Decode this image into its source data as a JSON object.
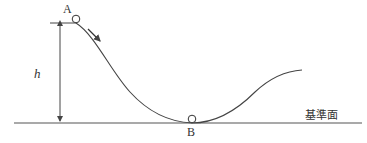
{
  "diagram": {
    "type": "physics-track",
    "labels": {
      "point_a": "A",
      "point_b": "B",
      "height": "h",
      "reference_plane": "基準面"
    },
    "colors": {
      "line": "#444444",
      "text": "#333333",
      "background": "#ffffff"
    },
    "elements": {
      "ball_a": {
        "cx": 76,
        "cy": 19,
        "r": 4
      },
      "ball_b": {
        "cx": 192,
        "cy": 119,
        "r": 4
      },
      "motion_arrow": "down-right along track"
    }
  }
}
